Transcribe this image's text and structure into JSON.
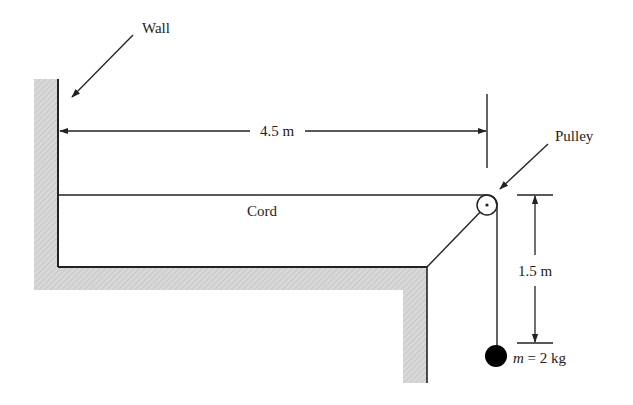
{
  "diagram": {
    "type": "physics-pulley-system",
    "colors": {
      "line": "#222222",
      "hatch_fill": "#d6d6d6",
      "hatch_stroke": "#bdbdbd",
      "mass": "#000000",
      "background": "#ffffff"
    },
    "labels": {
      "wall": "Wall",
      "pulley": "Pulley",
      "cord": "Cord",
      "horizontal_distance": "4.5 m",
      "vertical_distance": "1.5 m",
      "mass_symbol": "m",
      "mass_equals": " = 2 kg"
    },
    "values": {
      "horizontal_distance_m": 4.5,
      "vertical_distance_m": 1.5,
      "mass_kg": 2
    }
  }
}
